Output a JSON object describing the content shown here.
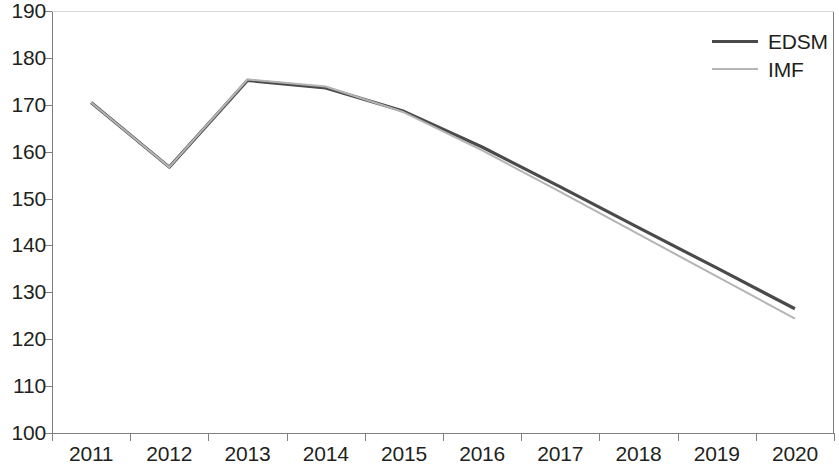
{
  "chart_data": {
    "type": "line",
    "title": "",
    "subtitle": "",
    "xlabel": "",
    "ylabel": "",
    "categories": [
      "2011",
      "2012",
      "2013",
      "2014",
      "2015",
      "2016",
      "2017",
      "2018",
      "2019",
      "2020"
    ],
    "x": [
      2011,
      2012,
      2013,
      2014,
      2015,
      2016,
      2017,
      2018,
      2019,
      2020
    ],
    "series": [
      {
        "name": "EDSM",
        "color": "#4a4a4a",
        "line_width": 3.2,
        "values": [
          170.5,
          156.7,
          175.2,
          173.6,
          168.6,
          161.0,
          152.5,
          143.8,
          135.2,
          126.5
        ]
      },
      {
        "name": "IMF",
        "color": "#b4b4b4",
        "line_width": 2.0,
        "values": [
          170.5,
          156.7,
          175.4,
          173.9,
          168.4,
          160.3,
          151.4,
          142.4,
          133.4,
          124.4
        ]
      }
    ],
    "ylim": [
      100,
      190
    ],
    "ytick_step": 10,
    "yticks": [
      100,
      110,
      120,
      130,
      140,
      150,
      160,
      170,
      180,
      190
    ],
    "ytick_labels": [
      "100",
      "110",
      "120",
      "130",
      "140",
      "150",
      "160",
      "170",
      "180",
      "190"
    ],
    "grid": false,
    "legend_position": "top-right",
    "axis_color": "#808080",
    "background": "#ffffff"
  },
  "legend": {
    "entries": [
      {
        "label": "EDSM",
        "swatch": "line-swatch-edsm"
      },
      {
        "label": "IMF",
        "swatch": "line-swatch-imf"
      }
    ]
  }
}
